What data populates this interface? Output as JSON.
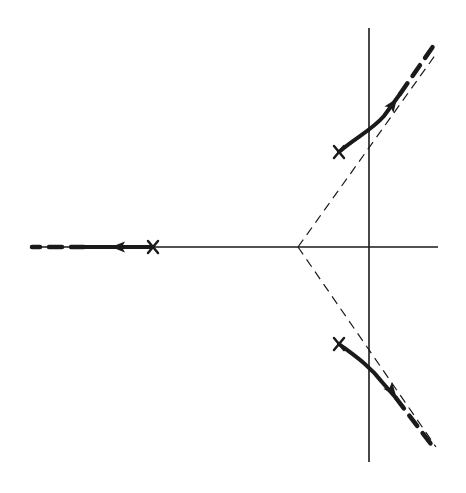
{
  "diagram": {
    "type": "root-locus",
    "background": "#ffffff",
    "ink_color": "#1a1a1a",
    "axes": {
      "real_axis": {
        "x1": 30,
        "y1": 247,
        "x2": 438,
        "y2": 247
      },
      "imag_axis": {
        "x1": 369,
        "y1": 28,
        "x2": 369,
        "y2": 462
      }
    },
    "asymptote_centroid": {
      "x": 298,
      "y": 247
    },
    "asymptotes": [
      {
        "name": "upper",
        "x1": 298,
        "y1": 247,
        "x2": 436,
        "y2": 54
      },
      {
        "name": "lower",
        "x1": 298,
        "y1": 247,
        "x2": 436,
        "y2": 447
      }
    ],
    "poles": [
      {
        "name": "real-pole",
        "x": 153,
        "y": 247
      },
      {
        "name": "upper-complex-pole",
        "x": 339,
        "y": 152
      },
      {
        "name": "lower-complex-pole",
        "x": 339,
        "y": 344
      }
    ],
    "branches": [
      {
        "name": "real-branch",
        "solid_path": "M153,247 L84,247",
        "dashed_path": "M84,247 L32,247",
        "arrow": {
          "x": 118,
          "y": 247,
          "angle": 180
        }
      },
      {
        "name": "upper-branch",
        "solid_path": "M339,152 C355,138 372,130 384,116 L400,94",
        "dashed_path": "M400,94 L434,45",
        "arrow": {
          "x": 393,
          "y": 104,
          "angle": -55
        }
      },
      {
        "name": "lower-branch",
        "solid_path": "M339,344 C355,356 370,366 382,382 L396,398",
        "dashed_path": "M396,398 L434,448",
        "arrow": {
          "x": 392,
          "y": 391,
          "angle": 52
        }
      }
    ]
  }
}
